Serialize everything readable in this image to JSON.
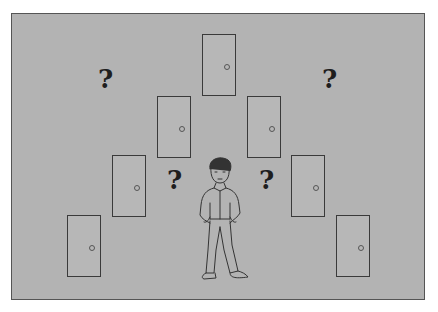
{
  "scene": {
    "description": "Man standing below a V-shaped arrangement of seven closed doors with four question marks",
    "background_color": "#b3b3b3",
    "question_mark": "?",
    "doors": [
      {
        "x": 67,
        "y": 215
      },
      {
        "x": 112,
        "y": 155
      },
      {
        "x": 157,
        "y": 96
      },
      {
        "x": 202,
        "y": 34
      },
      {
        "x": 247,
        "y": 96
      },
      {
        "x": 291,
        "y": 155
      },
      {
        "x": 336,
        "y": 215
      }
    ],
    "question_marks": [
      {
        "x": 98,
        "y": 66
      },
      {
        "x": 322,
        "y": 66
      },
      {
        "x": 167,
        "y": 167
      },
      {
        "x": 259,
        "y": 167
      }
    ]
  }
}
